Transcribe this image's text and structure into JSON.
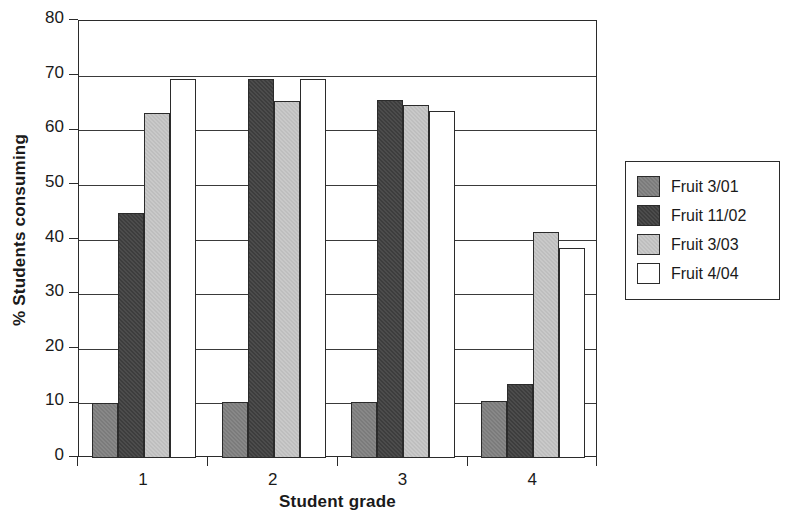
{
  "chart_data": {
    "type": "bar",
    "title": "",
    "xlabel": "Student grade",
    "ylabel": "% Students consuming",
    "categories": [
      "1",
      "2",
      "3",
      "4"
    ],
    "ylim": [
      0,
      80
    ],
    "ytick_step": 10,
    "yticks": [
      "80",
      "70",
      "60",
      "50",
      "40",
      "30",
      "20",
      "10",
      "0"
    ],
    "grid": true,
    "legend_position": "right",
    "series": [
      {
        "name": "Fruit 3/01",
        "color": "#7b7b7b",
        "values": [
          10.0,
          10.2,
          10.3,
          10.5
        ]
      },
      {
        "name": "Fruit 11/02",
        "color": "#3d3d3d",
        "values": [
          44.8,
          69.3,
          65.5,
          13.5
        ]
      },
      {
        "name": "Fruit 3/03",
        "color": "#c9c9c9",
        "values": [
          63.1,
          65.3,
          64.6,
          41.3
        ]
      },
      {
        "name": "Fruit 4/04",
        "color": "#ffffff",
        "values": [
          69.3,
          69.3,
          63.6,
          38.4
        ]
      }
    ]
  },
  "legend": {
    "entries": [
      "Fruit 3/01",
      "Fruit 11/02",
      "Fruit 3/03",
      "Fruit 4/04"
    ]
  }
}
